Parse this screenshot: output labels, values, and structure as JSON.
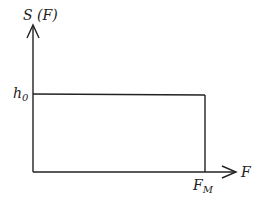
{
  "diagram": {
    "y_axis_label": "S (F)",
    "x_axis_label": "F",
    "level_label": "h",
    "level_subscript": "0",
    "cutoff_label": "F",
    "cutoff_subscript": "M",
    "line_color": "#222222"
  }
}
